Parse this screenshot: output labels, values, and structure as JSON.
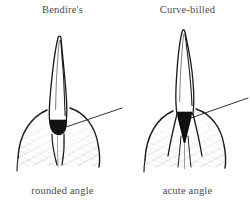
{
  "figure": {
    "type": "comparative-illustration",
    "background_color": "#ffffff",
    "ink_color": "#1a1a1a",
    "text_color": "#4a4a4a"
  },
  "panels": [
    {
      "id": "bendires",
      "title": "Bendire's",
      "caption": "rounded angle",
      "leader_label": "leader-line pointing to gape angle",
      "bill_shape": "straight slender spike",
      "gape_angle": "rounded"
    },
    {
      "id": "curve-billed",
      "title": "Curve-billed",
      "caption": "acute angle",
      "leader_label": "leader-line pointing to gape angle",
      "bill_shape": "deeper decurved bill",
      "gape_angle": "acute"
    }
  ]
}
